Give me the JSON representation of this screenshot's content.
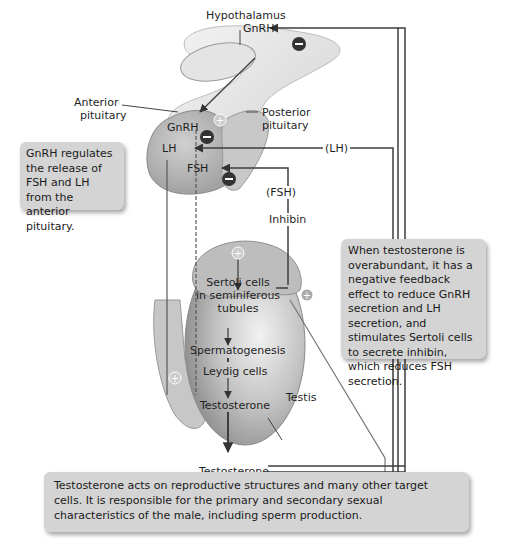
{
  "labels": {
    "hypothalamus": "Hypothalamus",
    "gnrh_top": "GnRH",
    "anterior_pituitary_1": "Anterior",
    "anterior_pituitary_2": "pituitary",
    "posterior_pituitary_1": "Posterior",
    "posterior_pituitary_2": "pituitary",
    "gnrh_pituitary": "GnRH",
    "lh": "LH",
    "fsh": "FSH",
    "lh_path": "(LH)",
    "fsh_path": "(FSH)",
    "inhibin": "Inhibin",
    "sertoli_1": "Sertoli cells",
    "sertoli_2": "in seminiferous",
    "sertoli_3": "tubules",
    "spermatogenesis": "Spermatogenesis",
    "leydig": "Leydig cells",
    "testosterone_inside": "Testosterone",
    "testis": "Testis",
    "testosterone_outside": "Testosterone"
  },
  "callouts": {
    "gnrh_note": "GnRH regulates the release of FSH and LH from the anterior pituitary.",
    "feedback_note": "When testosterone is overabundant, it has a negative feedback effect to reduce GnRH secretion and LH secretion, and stimulates Sertoli cells to secrete inhibin, which reduces FSH secretion.",
    "action_note": "Testosterone acts on reproductive structures and many other target cells. It is responsible for the primary and secondary sexual characteristics of the male, including sperm production."
  },
  "symbols": {
    "minus": "−",
    "plus": "+"
  },
  "colors": {
    "organ": "#b9b9b9",
    "organ_dark": "#8d8d8d",
    "line": "#3d3d3d",
    "callout": "#d4d4d4"
  }
}
